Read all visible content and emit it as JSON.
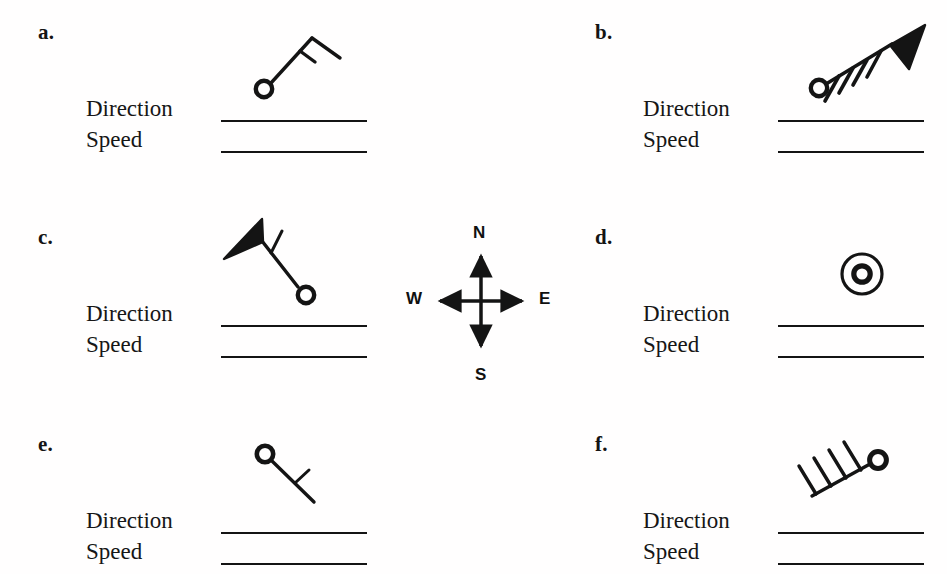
{
  "page": {
    "background_color": "#ffffff",
    "ink_color": "#141414",
    "kind": "worksheet",
    "topic": "wind barb station model identification"
  },
  "field_labels": {
    "direction": "Direction",
    "speed": "Speed"
  },
  "compass": {
    "name": "compass-rose",
    "north": "N",
    "south": "S",
    "west": "W",
    "east": "E",
    "arrow_style": "double-headed cross"
  },
  "panels": [
    {
      "id": "a",
      "letter": "a.",
      "direction_label": "Direction",
      "speed_label": "Speed",
      "direction_answer": "",
      "speed_answer": "",
      "symbol": {
        "name": "wind-barb-a",
        "station_circle": "open",
        "staff_heading": "up-right",
        "full_barbs": 1,
        "half_barbs": 1,
        "pennants": 0,
        "calm": false
      }
    },
    {
      "id": "b",
      "letter": "b.",
      "direction_label": "Direction",
      "speed_label": "Speed",
      "direction_answer": "",
      "speed_answer": "",
      "symbol": {
        "name": "wind-barb-b",
        "station_circle": "open",
        "staff_heading": "up-right",
        "full_barbs": 4,
        "half_barbs": 0,
        "pennants": 1,
        "calm": false
      }
    },
    {
      "id": "c",
      "letter": "c.",
      "direction_label": "Direction",
      "speed_label": "Speed",
      "direction_answer": "",
      "speed_answer": "",
      "symbol": {
        "name": "wind-barb-c",
        "station_circle": "open",
        "staff_heading": "up-left",
        "full_barbs": 1,
        "half_barbs": 0,
        "pennants": 1,
        "calm": false
      }
    },
    {
      "id": "d",
      "letter": "d.",
      "direction_label": "Direction",
      "speed_label": "Speed",
      "direction_answer": "",
      "speed_answer": "",
      "symbol": {
        "name": "wind-barb-d-calm",
        "station_circle": "double-ring",
        "staff_heading": "none",
        "full_barbs": 0,
        "half_barbs": 0,
        "pennants": 0,
        "calm": true
      }
    },
    {
      "id": "e",
      "letter": "e.",
      "direction_label": "Direction",
      "speed_label": "Speed",
      "direction_answer": "",
      "speed_answer": "",
      "symbol": {
        "name": "wind-barb-e",
        "station_circle": "open",
        "staff_heading": "down-right",
        "full_barbs": 1,
        "half_barbs": 0,
        "pennants": 0,
        "calm": false
      }
    },
    {
      "id": "f",
      "letter": "f.",
      "direction_label": "Direction",
      "speed_label": "Speed",
      "direction_answer": "",
      "speed_answer": "",
      "symbol": {
        "name": "wind-barb-f",
        "station_circle": "open",
        "staff_heading": "down-left",
        "full_barbs": 4,
        "half_barbs": 0,
        "pennants": 0,
        "calm": false
      }
    }
  ]
}
